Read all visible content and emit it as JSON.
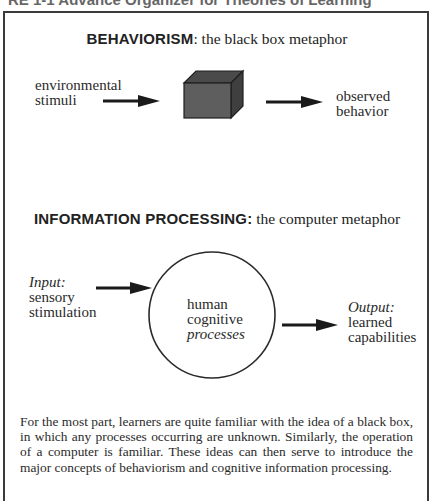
{
  "figure": {
    "caption_partial": "RE 1-1 Advance Organizer for Theories of Learning"
  },
  "behaviorism": {
    "heading_bold": "BEHAVIORISM",
    "heading_rest": ":  the black box metaphor",
    "input_label": [
      "environmental",
      "stimuli"
    ],
    "center_shape": "black-box-cube",
    "output_label": [
      "observed",
      "behavior"
    ]
  },
  "information_processing": {
    "heading_bold": "INFORMATION PROCESSING:",
    "heading_rest": "  the computer metaphor",
    "input": {
      "title": "Input:",
      "label": [
        "sensory",
        "stimulation"
      ]
    },
    "center": {
      "label": [
        "human",
        "cognitive"
      ],
      "label_italic": "processes"
    },
    "output": {
      "title": "Output:",
      "label": [
        "learned",
        "capabilities"
      ]
    }
  },
  "paragraph": "For the most part, learners are quite familiar with the idea of a black box, in which any processes occurring are unknown.  Similarly, the operation of a computer is familiar.  These ideas can then serve to introduce the major concepts of behaviorism and cognitive information processing.",
  "colors": {
    "border": "#3a3a3a",
    "cube_front": "#5e5e5e",
    "cube_top": "#4a4a4a",
    "cube_side": "#3f3f3f",
    "text": "#2a2a2a"
  }
}
